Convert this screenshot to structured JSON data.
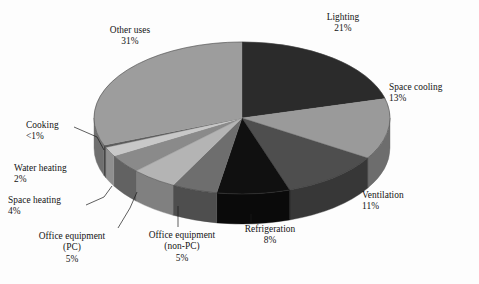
{
  "figure": {
    "type": "pie-3d",
    "background": "#fdfdfd",
    "text_color": "#141414"
  },
  "chart_data": {
    "type": "pie",
    "title": "",
    "subtitle": "",
    "xlabel": "",
    "ylabel": "",
    "legend_position": "none",
    "grid": false,
    "three_d": true,
    "start_angle_deg": 0,
    "direction": "clockwise",
    "labels_show_percent": true,
    "categories": [
      "Lighting",
      "Space cooling",
      "Ventilation",
      "Refrigeration",
      "Office equipment (non-PC)",
      "Office equipment (PC)",
      "Space heating",
      "Water heating",
      "Cooking",
      "Other uses"
    ],
    "values": [
      21,
      13,
      11,
      8,
      5,
      5,
      4,
      2,
      0.5,
      31
    ],
    "value_labels": [
      "21%",
      "13%",
      "11%",
      "8%",
      "5%",
      "5%",
      "4%",
      "2%",
      "<1%",
      "31%"
    ],
    "colors": [
      "#2b2b2b",
      "#9a9a9a",
      "#4e4e4e",
      "#101010",
      "#6e6e6e",
      "#b4b4b4",
      "#8a8a8a",
      "#c8c8c8",
      "#5c5c5c",
      "#9d9d9d"
    ],
    "slices": [
      {
        "name": "Lighting",
        "value": 21,
        "value_label": "21%",
        "color": "#2b2b2b",
        "side_color": "#1d1d1d"
      },
      {
        "name": "Space cooling",
        "value": 13,
        "value_label": "13%",
        "color": "#9a9a9a",
        "side_color": "#6d6d6d"
      },
      {
        "name": "Ventilation",
        "value": 11,
        "value_label": "11%",
        "color": "#4e4e4e",
        "side_color": "#373737"
      },
      {
        "name": "Refrigeration",
        "value": 8,
        "value_label": "8%",
        "color": "#101010",
        "side_color": "#0a0a0a"
      },
      {
        "name": "Office equipment (non-PC)",
        "value": 5,
        "value_label": "5%",
        "color": "#6e6e6e",
        "side_color": "#4e4e4e"
      },
      {
        "name": "Office equipment (PC)",
        "value": 5,
        "value_label": "5%",
        "color": "#b4b4b4",
        "side_color": "#808080"
      },
      {
        "name": "Space heating",
        "value": 4,
        "value_label": "4%",
        "color": "#8a8a8a",
        "side_color": "#626262"
      },
      {
        "name": "Water heating",
        "value": 2,
        "value_label": "2%",
        "color": "#c8c8c8",
        "side_color": "#8f8f8f"
      },
      {
        "name": "Cooking",
        "value": 0.5,
        "value_label": "<1%",
        "color": "#5c5c5c",
        "side_color": "#414141"
      },
      {
        "name": "Other uses",
        "value": 31,
        "value_label": "31%",
        "color": "#9d9d9d",
        "side_color": "#6f6f6f"
      }
    ]
  },
  "labels": {
    "lighting": {
      "name": "Lighting",
      "percent": "21%"
    },
    "space_cooling": {
      "name": "Space cooling",
      "percent": "13%"
    },
    "ventilation": {
      "name": "Ventilation",
      "percent": "11%"
    },
    "refrigeration": {
      "name": "Refrigeration",
      "percent": "8%"
    },
    "office_non_pc": {
      "name": "Office equipment",
      "name2": "(non-PC)",
      "percent": "5%"
    },
    "office_pc": {
      "name": "Office equipment",
      "name2": "(PC)",
      "percent": "5%"
    },
    "space_heating": {
      "name": "Space heating",
      "percent": "4%"
    },
    "water_heating": {
      "name": "Water heating",
      "percent": "2%"
    },
    "cooking": {
      "name": "Cooking",
      "percent": "<1%"
    },
    "other_uses": {
      "name": "Other uses",
      "percent": "31%"
    }
  }
}
